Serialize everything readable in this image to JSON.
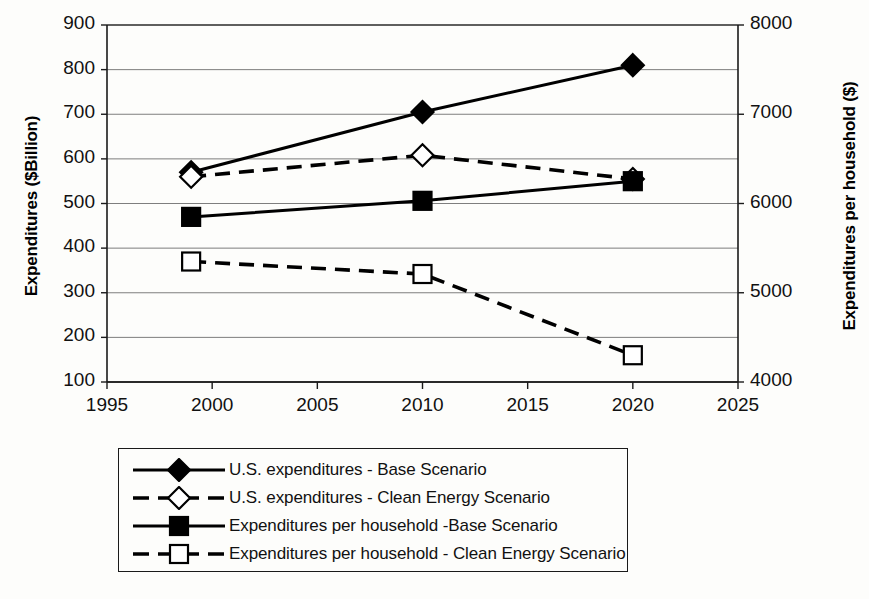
{
  "chart_data": {
    "type": "line",
    "title": "",
    "xlabel": "",
    "ylabel": "Expenditures ($Billion)",
    "ylabel_right": "Expenditures per household ($)",
    "x": [
      1999,
      2010,
      2020
    ],
    "xlim": [
      1995,
      2025
    ],
    "xticks": [
      "1995",
      "2000",
      "2005",
      "2010",
      "2015",
      "2020",
      "2025"
    ],
    "ylim": [
      100,
      900
    ],
    "yticks": [
      "100",
      "200",
      "300",
      "400",
      "500",
      "600",
      "700",
      "800",
      "900"
    ],
    "ylim_right": [
      4000,
      8000
    ],
    "yticks_right": [
      "4000",
      "5000",
      "6000",
      "7000",
      "8000"
    ],
    "grid": true,
    "legend_position": "below-plot",
    "series": [
      {
        "name": "U.S. expenditures - Base Scenario",
        "axis": "left",
        "marker": "filled-diamond",
        "linestyle": "solid",
        "color": "#000000",
        "values": [
          570,
          705,
          810
        ]
      },
      {
        "name": "U.S. expenditures - Clean Energy Scenario",
        "axis": "left",
        "marker": "open-diamond",
        "linestyle": "dashed",
        "color": "#000000",
        "values": [
          560,
          608,
          555
        ]
      },
      {
        "name": "Expenditures per household -Base Scenario",
        "axis": "right",
        "marker": "filled-square",
        "linestyle": "solid",
        "color": "#000000",
        "values": [
          5850,
          6030,
          6250
        ]
      },
      {
        "name": "Expenditures per household - Clean Energy Scenario",
        "axis": "right",
        "marker": "open-square",
        "linestyle": "dashed",
        "color": "#000000",
        "values": [
          5350,
          5210,
          4300
        ]
      }
    ]
  },
  "legend": {
    "items": [
      {
        "label": "U.S. expenditures - Base Scenario",
        "marker": "filled-diamond",
        "linestyle": "solid"
      },
      {
        "label": "U.S. expenditures - Clean Energy Scenario",
        "marker": "open-diamond",
        "linestyle": "dashed"
      },
      {
        "label": "Expenditures per household -Base Scenario",
        "marker": "filled-square",
        "linestyle": "solid"
      },
      {
        "label": "Expenditures per household - Clean Energy Scenario",
        "marker": "open-square",
        "linestyle": "dashed"
      }
    ]
  },
  "colors": {
    "ink": "#000000",
    "grid": "#6f6f6f",
    "background": "#fdfdfb"
  }
}
